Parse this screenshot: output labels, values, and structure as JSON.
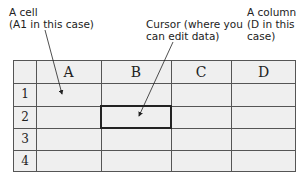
{
  "annotations": {
    "cell": "A cell\n(A1 in this case)",
    "cursor": "Cursor (where you\ncan edit data)",
    "column": "A column\n(D in this\ncase)"
  },
  "grid": {
    "columns": [
      "A",
      "B",
      "C",
      "D"
    ],
    "rows": [
      "1",
      "2",
      "3",
      "4"
    ],
    "active_cell": "B2"
  },
  "colors": {
    "grid_background": "#efefef",
    "grid_lines": "#555555",
    "text": "#222222"
  }
}
